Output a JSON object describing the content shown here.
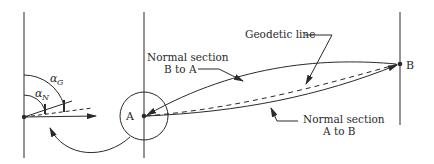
{
  "diagram": {
    "labels": {
      "point_a": "A",
      "point_b": "B",
      "geodetic_line": "Geodetic line",
      "normal_ba_line1": "Normal section",
      "normal_ba_line2": "B to A",
      "normal_ab_line1": "Normal section",
      "normal_ab_line2": "A to B",
      "alpha_g": "α",
      "alpha_g_sub": "G",
      "alpha_n": "α",
      "alpha_n_sub": "N"
    },
    "colors": {
      "stroke": "#2a2a2a",
      "background": "#ffffff"
    }
  }
}
